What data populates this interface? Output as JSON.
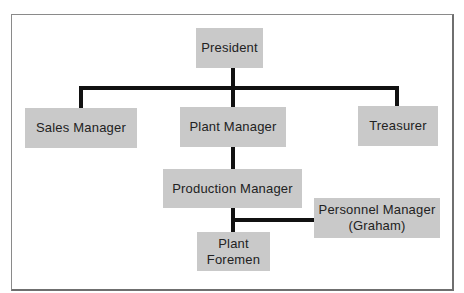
{
  "diagram": {
    "type": "org-chart",
    "nodes": [
      {
        "id": "president",
        "label": "President"
      },
      {
        "id": "sales",
        "label": "Sales Manager"
      },
      {
        "id": "plant",
        "label": "Plant Manager"
      },
      {
        "id": "treasurer",
        "label": "Treasurer"
      },
      {
        "id": "production",
        "label": "Production Manager"
      },
      {
        "id": "personnel",
        "label_line1": "Personnel Manager",
        "label_line2": "(Graham)"
      },
      {
        "id": "foremen",
        "label_line1": "Plant",
        "label_line2": "Foremen"
      }
    ],
    "edges": [
      [
        "president",
        "sales"
      ],
      [
        "president",
        "plant"
      ],
      [
        "president",
        "treasurer"
      ],
      [
        "plant",
        "production"
      ],
      [
        "production",
        "foremen"
      ],
      [
        "production",
        "personnel"
      ]
    ],
    "colors": {
      "box": "#c9c9c9",
      "line": "#111111",
      "text": "#222222"
    }
  }
}
